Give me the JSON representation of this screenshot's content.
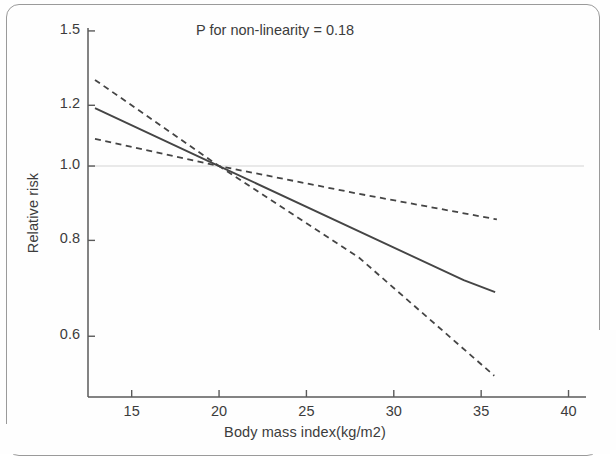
{
  "figure": {
    "annotation": "P for non-linearity = 0.18",
    "x_axis_title": "Body mass index(kg/m2)",
    "y_axis_title": "Relative risk"
  },
  "chart_data": {
    "type": "line",
    "title": "",
    "subtitle": "",
    "xlabel": "Body mass index(kg/m2)",
    "ylabel": "Relative risk",
    "xlim": [
      12.5,
      41.0
    ],
    "ylim": [
      0.5,
      1.55
    ],
    "yscale": "log",
    "grid": false,
    "legend": null,
    "annotations": [
      {
        "text": "P for non-linearity = 0.18",
        "x": 26.0,
        "y": 1.44
      }
    ],
    "xticks": [
      15,
      20,
      25,
      30,
      35,
      40
    ],
    "xtick_labels": [
      "15",
      "20",
      "25",
      "30",
      "35",
      "40"
    ],
    "yticks": [
      0.6,
      0.8,
      1.0,
      1.2,
      1.5
    ],
    "ytick_labels": [
      "0.6",
      "0.8",
      "1.0",
      "1.2",
      "1.5"
    ],
    "reference_line": {
      "orientation": "horizontal",
      "y": 1.0,
      "style": "solid-faint"
    },
    "reference_point": {
      "x": 20.0,
      "y": 1.0
    },
    "series": [
      {
        "name": "Relative risk (spline fit)",
        "style": "solid",
        "color": "#454545",
        "x": [
          12.9,
          20.0,
          34.0,
          35.8
        ],
        "values": [
          1.19,
          1.0,
          0.71,
          0.685
        ]
      },
      {
        "name": "Upper 95% confidence limit",
        "style": "dashed",
        "color": "#454545",
        "x": [
          12.9,
          20.0,
          28.0,
          35.9
        ],
        "values": [
          1.295,
          1.0,
          0.92,
          0.852
        ]
      },
      {
        "name": "Lower 95% confidence limit",
        "style": "dashed",
        "color": "#454545",
        "x": [
          12.9,
          20.0,
          28.0,
          35.75
        ],
        "values": [
          1.085,
          1.0,
          0.76,
          0.533
        ]
      }
    ]
  }
}
